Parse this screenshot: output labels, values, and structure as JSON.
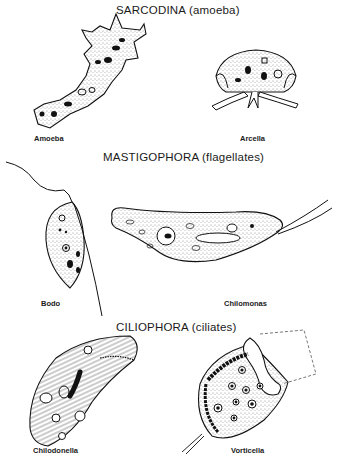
{
  "figure": {
    "sections": [
      {
        "heading": "SARCODINA   (amoeba)",
        "organisms": [
          {
            "name": "Amoeba"
          },
          {
            "name": "Arcella"
          }
        ]
      },
      {
        "heading": "MASTIGOPHORA   (flagellates)",
        "organisms": [
          {
            "name": "Bodo"
          },
          {
            "name": "Chilomonas"
          }
        ]
      },
      {
        "heading": "CILIOPHORA   (ciliates)",
        "organisms": [
          {
            "name": "Chilodonella"
          },
          {
            "name": "Vorticella"
          }
        ]
      }
    ]
  }
}
